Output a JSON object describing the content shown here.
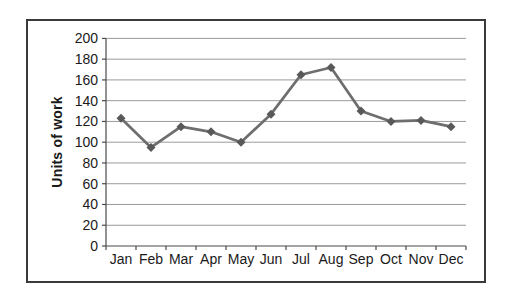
{
  "chart_data": {
    "type": "line",
    "title": "",
    "xlabel": "",
    "ylabel": "Units of work",
    "categories": [
      "Jan",
      "Feb",
      "Mar",
      "Apr",
      "May",
      "Jun",
      "Jul",
      "Aug",
      "Sep",
      "Oct",
      "Nov",
      "Dec"
    ],
    "series": [
      {
        "name": "Units of work",
        "values": [
          123,
          95,
          115,
          110,
          100,
          127,
          165,
          172,
          130,
          120,
          121,
          115
        ]
      }
    ],
    "ylim": [
      0,
      200
    ],
    "ytick_step": 20,
    "ytick_labels": [
      "0",
      "20",
      "40",
      "60",
      "80",
      "100",
      "120",
      "140",
      "160",
      "180",
      "200"
    ],
    "grid": "horizontal",
    "legend": "none",
    "marker": "diamond",
    "colors": {
      "line": "#6e6e6e",
      "marker": "#595959",
      "gridline": "#9a9a9a",
      "axis": "#4a4a4a",
      "text": "#1a1a1a",
      "frame_border": "#3a3a3a",
      "background": "#ffffff"
    }
  }
}
